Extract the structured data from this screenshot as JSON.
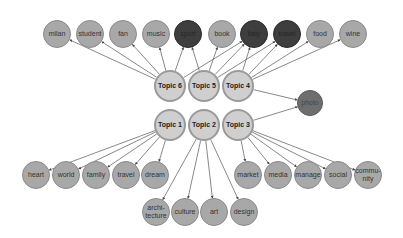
{
  "diagram": {
    "type": "topic-word network",
    "topics": [
      {
        "id": "t6",
        "label": "Topic 6",
        "x": 170,
        "y": 86
      },
      {
        "id": "t5",
        "label": "Topic 5",
        "x": 204,
        "y": 86
      },
      {
        "id": "t4",
        "label": "Topic 4",
        "x": 238,
        "y": 86
      },
      {
        "id": "t1",
        "label": "Topic 1",
        "x": 170,
        "y": 125
      },
      {
        "id": "t2",
        "label": "Topic 2",
        "x": 204,
        "y": 125
      },
      {
        "id": "t3",
        "label": "Topic 3",
        "x": 238,
        "y": 125
      }
    ],
    "words": [
      {
        "id": "milan",
        "label": "milan",
        "x": 57,
        "y": 34,
        "shade": "light"
      },
      {
        "id": "student",
        "label": "student",
        "x": 90,
        "y": 34,
        "shade": "light"
      },
      {
        "id": "fan",
        "label": "fan",
        "x": 123,
        "y": 34,
        "shade": "light"
      },
      {
        "id": "music",
        "label": "music",
        "x": 156,
        "y": 34,
        "shade": "light"
      },
      {
        "id": "sport",
        "label": "sport",
        "x": 188,
        "y": 34,
        "shade": "dark"
      },
      {
        "id": "book",
        "label": "book",
        "x": 222,
        "y": 34,
        "shade": "light"
      },
      {
        "id": "italy",
        "label": "italy",
        "x": 254,
        "y": 34,
        "shade": "dark"
      },
      {
        "id": "travel_top",
        "label": "travel",
        "x": 287,
        "y": 34,
        "shade": "dark"
      },
      {
        "id": "food",
        "label": "food",
        "x": 320,
        "y": 34,
        "shade": "light"
      },
      {
        "id": "wine",
        "label": "wine",
        "x": 353,
        "y": 34,
        "shade": "light"
      },
      {
        "id": "photo",
        "label": "photo",
        "x": 310,
        "y": 103,
        "shade": "medium"
      },
      {
        "id": "heart",
        "label": "heart",
        "x": 36,
        "y": 175,
        "shade": "light"
      },
      {
        "id": "world",
        "label": "world",
        "x": 66,
        "y": 175,
        "shade": "light"
      },
      {
        "id": "family",
        "label": "family",
        "x": 96,
        "y": 175,
        "shade": "light"
      },
      {
        "id": "travel",
        "label": "travel",
        "x": 126,
        "y": 175,
        "shade": "light"
      },
      {
        "id": "dream",
        "label": "dream",
        "x": 155,
        "y": 175,
        "shade": "light"
      },
      {
        "id": "market",
        "label": "market",
        "x": 248,
        "y": 175,
        "shade": "light"
      },
      {
        "id": "media",
        "label": "media",
        "x": 278,
        "y": 175,
        "shade": "light"
      },
      {
        "id": "manage",
        "label": "manage",
        "x": 308,
        "y": 175,
        "shade": "light"
      },
      {
        "id": "social",
        "label": "social",
        "x": 338,
        "y": 175,
        "shade": "light"
      },
      {
        "id": "community",
        "label": "commu-\nnity",
        "x": 368,
        "y": 175,
        "shade": "light"
      },
      {
        "id": "architecture",
        "label": "archi-\ntecture",
        "x": 156,
        "y": 212,
        "shade": "light"
      },
      {
        "id": "culture",
        "label": "culture",
        "x": 185,
        "y": 212,
        "shade": "light"
      },
      {
        "id": "art",
        "label": "art",
        "x": 214,
        "y": 212,
        "shade": "light"
      },
      {
        "id": "design",
        "label": "design",
        "x": 244,
        "y": 212,
        "shade": "light"
      }
    ],
    "edges": [
      [
        "t6",
        "milan"
      ],
      [
        "t6",
        "student"
      ],
      [
        "t6",
        "fan"
      ],
      [
        "t6",
        "music"
      ],
      [
        "t6",
        "sport"
      ],
      [
        "t6",
        "italy"
      ],
      [
        "t5",
        "sport"
      ],
      [
        "t5",
        "book"
      ],
      [
        "t5",
        "italy"
      ],
      [
        "t5",
        "travel_top"
      ],
      [
        "t4",
        "italy"
      ],
      [
        "t4",
        "travel_top"
      ],
      [
        "t4",
        "food"
      ],
      [
        "t4",
        "wine"
      ],
      [
        "t4",
        "photo"
      ],
      [
        "t1",
        "heart"
      ],
      [
        "t1",
        "world"
      ],
      [
        "t1",
        "family"
      ],
      [
        "t1",
        "travel"
      ],
      [
        "t1",
        "dream"
      ],
      [
        "t2",
        "architecture"
      ],
      [
        "t2",
        "culture"
      ],
      [
        "t2",
        "art"
      ],
      [
        "t2",
        "design"
      ],
      [
        "t3",
        "photo"
      ],
      [
        "t3",
        "market"
      ],
      [
        "t3",
        "media"
      ],
      [
        "t3",
        "manage"
      ],
      [
        "t3",
        "social"
      ],
      [
        "t3",
        "community"
      ]
    ],
    "colors": {
      "edge": "#555555",
      "word_light": "#a8a8a8",
      "word_dark": "#3e3e3e",
      "topic_fill": "#cfcfcf",
      "topic_border": "#9a9a9a",
      "photo_fill": "#6e6e6e"
    }
  }
}
